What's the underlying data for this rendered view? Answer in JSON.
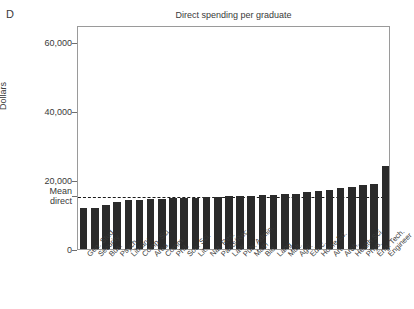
{
  "panel": {
    "label": "D"
  },
  "chart_data": {
    "type": "bar",
    "title": "Direct spending per graduate",
    "xlabel": "",
    "ylabel": "Dollars",
    "ylim": [
      0,
      65000
    ],
    "yticks": [
      0,
      20000,
      40000,
      60000
    ],
    "ytick_labels": [
      "0",
      "20,000",
      "40,000",
      "60,000"
    ],
    "grid": false,
    "legend": null,
    "annotations": [
      {
        "name": "mean-direct-line",
        "label": "Mean\ndirect",
        "label_line1": "Mean",
        "label_line2": "direct",
        "value": 15700,
        "style": "dotted-horizontal"
      }
    ],
    "bar_color": "#2b2b2b",
    "categories": [
      "Gen. Stud.",
      "Security",
      "Bus.",
      "Psych.",
      "Library",
      "Comp. Sci.",
      "Area",
      "Comm.",
      "Phil.",
      "Soc. Sci.",
      "Lit.",
      "Nat. Res.",
      "Parks/Rec.",
      "Law",
      "Pub. Admin.",
      "Math",
      "Bio",
      "Lang",
      "Mult.",
      "Agri.",
      "Educ.",
      "Home Ec.",
      "Art",
      "Arch.",
      "Health Sci.",
      "Phys.",
      "Eng. Tech.",
      "Engineer"
    ],
    "values": [
      11800,
      11800,
      12700,
      13500,
      14300,
      14100,
      14500,
      14600,
      14700,
      14800,
      14900,
      15000,
      15200,
      15300,
      15400,
      15500,
      15700,
      15800,
      15900,
      16000,
      16400,
      16900,
      17000,
      17600,
      17900,
      18500,
      18900,
      24000
    ]
  }
}
